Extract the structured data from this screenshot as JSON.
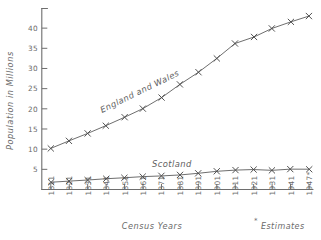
{
  "chart_data": {
    "type": "line",
    "title": "",
    "xlabel": "Census Years",
    "ylabel": "Population in Millions",
    "categories": [
      "1811",
      "1821",
      "1831",
      "1841",
      "1851",
      "1861",
      "1871",
      "1881",
      "1891",
      "1901",
      "1911",
      "1921",
      "1931",
      "1941",
      "1947*"
    ],
    "x": [
      1811,
      1821,
      1831,
      1841,
      1851,
      1861,
      1871,
      1881,
      1891,
      1901,
      1911,
      1921,
      1931,
      1941,
      1947
    ],
    "series": [
      {
        "name": "England and Wales",
        "values": [
          10.2,
          12.0,
          13.9,
          15.9,
          17.9,
          20.1,
          22.7,
          26.0,
          29.0,
          32.5,
          36.1,
          37.9,
          39.9,
          41.5,
          43.0
        ]
      },
      {
        "name": "Scotland",
        "values": [
          1.8,
          2.1,
          2.4,
          2.6,
          2.9,
          3.1,
          3.4,
          3.7,
          4.0,
          4.5,
          4.8,
          4.9,
          4.8,
          5.0,
          5.1
        ]
      }
    ],
    "ylim": [
      0,
      44
    ],
    "yticks": [
      5,
      10,
      15,
      20,
      25,
      30,
      35,
      40
    ],
    "ytick_labels": [
      "5",
      "10",
      "15",
      "20",
      "25",
      "30",
      "35",
      "40"
    ],
    "grid": false,
    "legend": "inline-annotations",
    "marker": "x",
    "annotations": [
      {
        "text": "England and Wales",
        "kind": "series-label"
      },
      {
        "text": "Scotland",
        "kind": "series-label"
      }
    ],
    "footnote": {
      "symbol": "*",
      "text": "Estimates"
    },
    "colors": {
      "line": "#5d5d5d",
      "axis": "#6e6e6e",
      "text": "#6a6a6a",
      "background": "#ffffff"
    }
  }
}
